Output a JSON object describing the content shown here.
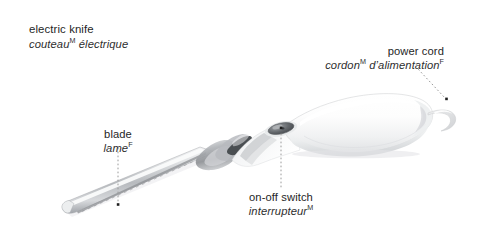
{
  "page": {
    "background_color": "#ffffff",
    "width": 492,
    "height": 232
  },
  "title": {
    "english": "electric knife",
    "french_main": "couteau",
    "french_gender": "M",
    "french_rest": " électrique"
  },
  "labels": {
    "power_cord": {
      "english": "power cord",
      "french_main": "cordon",
      "french_gender": "M",
      "french_rest": " d’alimentation",
      "french_gender2": "F"
    },
    "blade": {
      "english": "blade",
      "french_main": "lame",
      "french_gender": "F"
    },
    "switch": {
      "english": "on-off switch",
      "french_main": "interrupteur",
      "french_gender": "M"
    }
  },
  "colors": {
    "text": "#262626",
    "leader_line": "#9a9a9a",
    "leader_dot": "#1f1f1f",
    "handle_body": "#fdfdfd",
    "handle_shadow": "#d8d9db",
    "handle_outline": "#c9cbcd",
    "blade_steel": "#b9bcc0",
    "blade_highlight": "#f2f3f4",
    "collar_gray": "#a9acb0",
    "switch_dark": "#4e5256",
    "cord_gray": "#dfe0e2"
  },
  "leaders": {
    "power_cord": {
      "from_x": 418,
      "from_y": 69,
      "to_x": 446,
      "to_y": 99,
      "style": "dotted-diagonal"
    },
    "blade": {
      "from_x": 118,
      "from_y": 148,
      "to_x": 118,
      "to_y": 204,
      "style": "dotted-vertical"
    },
    "switch": {
      "from_x": 281,
      "from_y": 132,
      "to_x": 281,
      "to_y": 188,
      "style": "dotted-vertical"
    }
  }
}
